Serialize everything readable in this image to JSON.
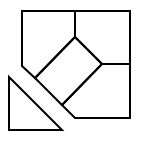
{
  "diagram": {
    "stroke_color": "#000000",
    "background_color": "#ffffff",
    "pieces": [
      {
        "name": "top-left-pentagon"
      },
      {
        "name": "top-right-square"
      },
      {
        "name": "center-rotated-rectangle"
      },
      {
        "name": "bottom-right-pentagon"
      },
      {
        "name": "detached-triangle"
      }
    ]
  }
}
